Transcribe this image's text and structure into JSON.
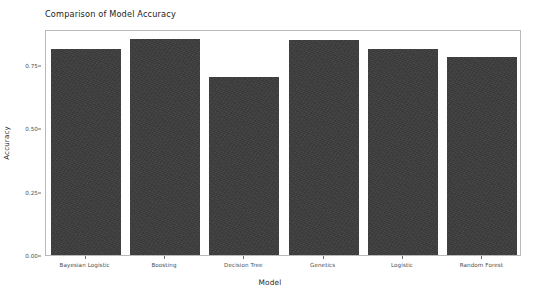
{
  "chart_data": {
    "type": "bar",
    "title": "Comparison of Model Accuracy",
    "xlabel": "Model",
    "ylabel": "Accuracy",
    "categories": [
      "Bayesian Logistic",
      "Boosting",
      "Decision Tree",
      "Genetics",
      "Logistic",
      "Random Forest"
    ],
    "values": [
      0.81,
      0.85,
      0.7,
      0.845,
      0.81,
      0.78
    ],
    "ylim": [
      0.0,
      0.89
    ],
    "ytick_values": [
      0.0,
      0.25,
      0.5,
      0.75
    ],
    "ytick_labels": [
      "0.00",
      "0.25",
      "0.50",
      "0.75"
    ],
    "grid": false,
    "legend": "none",
    "bar_color": "#3c3c3c",
    "panel_border_color": "#b9b9b9",
    "background_color": "#ffffff"
  }
}
